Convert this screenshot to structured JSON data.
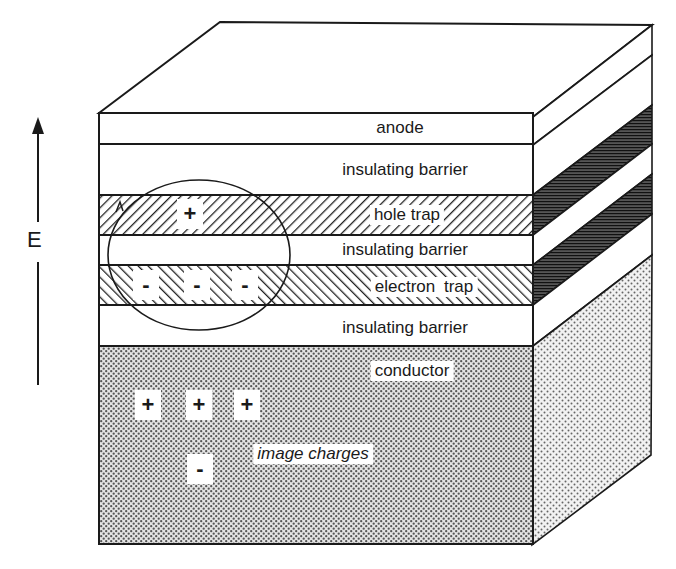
{
  "figure": {
    "type": "layered-device-cross-section",
    "field_label": "E",
    "layers": [
      {
        "id": "anode",
        "label": "anode",
        "pattern": "plain",
        "label_style": "normal"
      },
      {
        "id": "insulating-barrier-1",
        "label": "insulating barrier",
        "pattern": "plain",
        "label_style": "normal"
      },
      {
        "id": "hole-trap",
        "label": "hole trap",
        "pattern": "forward-hatch",
        "label_style": "normal"
      },
      {
        "id": "insulating-barrier-2",
        "label": "insulating barrier",
        "pattern": "plain",
        "label_style": "normal"
      },
      {
        "id": "electron-trap",
        "label": "electron trap",
        "pattern": "back-hatch",
        "label_style": "normal"
      },
      {
        "id": "insulating-barrier-3",
        "label": "insulating barrier",
        "pattern": "plain",
        "label_style": "normal"
      },
      {
        "id": "conductor",
        "label": "conductor",
        "pattern": "dots",
        "label_style": "normal"
      }
    ],
    "annotations": {
      "image_charges_label": "image charges",
      "hole_trap_charges": [
        "+"
      ],
      "electron_trap_charges": [
        "-",
        "-",
        "-"
      ],
      "conductor_positive_image_charges": [
        "+",
        "+",
        "+"
      ],
      "conductor_negative_image_charges": [
        "-"
      ]
    },
    "colors": {
      "line": "#1a1a1a",
      "background": "#ffffff",
      "side_hatch": "#333333"
    }
  }
}
